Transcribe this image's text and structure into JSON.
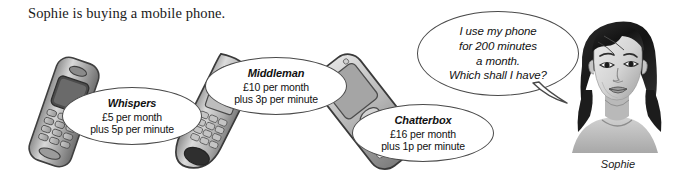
{
  "page": {
    "title": "Sophie is buying a mobile phone.",
    "background_color": "#ffffff",
    "ink_color": "#4a4a4a"
  },
  "tariffs": [
    {
      "name": "Whispers",
      "monthly": "£5 per month",
      "per_minute": "plus 5p per minute",
      "phone_label": "candy-bar-phone"
    },
    {
      "name": "Middleman",
      "monthly": "£10 per month",
      "per_minute": "plus 3p per minute",
      "phone_label": "curved-handset-phone"
    },
    {
      "name": "Chatterbox",
      "monthly": "£16 per month",
      "per_minute": "plus 1p per minute",
      "phone_label": "slide-phone"
    }
  ],
  "speech": {
    "line1": "I use my phone",
    "line2": "for 200 minutes",
    "line3": "a month.",
    "line4": "Which shall I have?"
  },
  "person": {
    "caption": "Sophie"
  }
}
